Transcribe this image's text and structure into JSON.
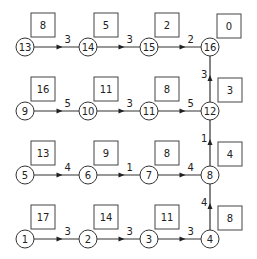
{
  "diagram": {
    "type": "grid network with stage values",
    "nodes": [
      {
        "id": "1",
        "label": "1",
        "x": 25,
        "y": 239,
        "value": "17"
      },
      {
        "id": "2",
        "label": "2",
        "x": 88,
        "y": 239,
        "value": "14"
      },
      {
        "id": "3",
        "label": "3",
        "x": 149,
        "y": 239,
        "value": "11"
      },
      {
        "id": "4",
        "label": "4",
        "x": 210,
        "y": 239,
        "value": "8"
      },
      {
        "id": "5",
        "label": "5",
        "x": 25,
        "y": 175,
        "value": "13"
      },
      {
        "id": "6",
        "label": "6",
        "x": 88,
        "y": 175,
        "value": "9"
      },
      {
        "id": "7",
        "label": "7",
        "x": 149,
        "y": 175,
        "value": "8"
      },
      {
        "id": "8",
        "label": "8",
        "x": 210,
        "y": 175,
        "value": "4"
      },
      {
        "id": "9",
        "label": "9",
        "x": 25,
        "y": 111,
        "value": "16"
      },
      {
        "id": "10",
        "label": "10",
        "x": 88,
        "y": 111,
        "value": "11"
      },
      {
        "id": "11",
        "label": "11",
        "x": 149,
        "y": 111,
        "value": "8"
      },
      {
        "id": "12",
        "label": "12",
        "x": 210,
        "y": 111,
        "value": "3"
      },
      {
        "id": "13",
        "label": "13",
        "x": 25,
        "y": 47,
        "value": "8"
      },
      {
        "id": "14",
        "label": "14",
        "x": 88,
        "y": 47,
        "value": "5"
      },
      {
        "id": "15",
        "label": "15",
        "x": 149,
        "y": 47,
        "value": "2"
      },
      {
        "id": "16",
        "label": "16",
        "x": 210,
        "y": 47,
        "value": "0"
      }
    ],
    "edges": [
      {
        "from": "1",
        "to": "2",
        "weight": "3"
      },
      {
        "from": "2",
        "to": "3",
        "weight": "3"
      },
      {
        "from": "3",
        "to": "4",
        "weight": "3"
      },
      {
        "from": "4",
        "to": "8",
        "weight": "4"
      },
      {
        "from": "5",
        "to": "6",
        "weight": "4"
      },
      {
        "from": "6",
        "to": "7",
        "weight": "1"
      },
      {
        "from": "7",
        "to": "8",
        "weight": "4"
      },
      {
        "from": "8",
        "to": "12",
        "weight": "1"
      },
      {
        "from": "9",
        "to": "10",
        "weight": "5"
      },
      {
        "from": "10",
        "to": "11",
        "weight": "3"
      },
      {
        "from": "11",
        "to": "12",
        "weight": "5"
      },
      {
        "from": "12",
        "to": "16",
        "weight": "3"
      },
      {
        "from": "13",
        "to": "14",
        "weight": "3"
      },
      {
        "from": "14",
        "to": "15",
        "weight": "3"
      },
      {
        "from": "15",
        "to": "16",
        "weight": "2"
      }
    ],
    "colors": {
      "stroke": "#333333",
      "background": "#ffffff",
      "text": "#222222"
    }
  }
}
